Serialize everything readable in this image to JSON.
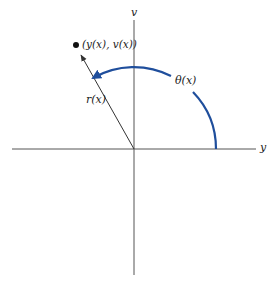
{
  "diagram": {
    "type": "polar-coordinates-figure",
    "axes": {
      "horizontal_label": "y",
      "vertical_label": "v"
    },
    "point_label": "(y(x), v(x))",
    "radius_label": "r(x)",
    "angle_label": "θ(x)",
    "colors": {
      "axis": "#555555",
      "radius_arrow": "#333333",
      "angle_arc": "#1f4e9c",
      "point": "#111111"
    }
  }
}
